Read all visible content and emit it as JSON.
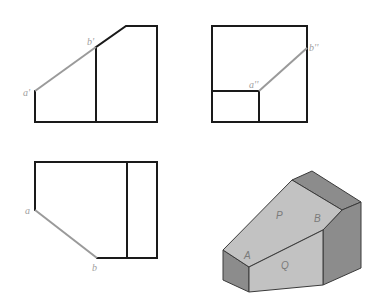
{
  "figure": {
    "front_view": {
      "label_a": "a'",
      "label_b": "b'"
    },
    "side_view": {
      "label_a": "a''",
      "label_b": "b''"
    },
    "top_view": {
      "label_a": "a",
      "label_b": "b"
    },
    "isometric": {
      "face_labels": [
        "P",
        "B",
        "A",
        "Q"
      ],
      "colors": {
        "light_face": "#c2c2c2",
        "dark_face": "#8c8c8c",
        "edge": "#3a3a3a"
      }
    },
    "colors": {
      "outline": "#1a1a1a",
      "highlight_line": "#9a9a9a",
      "label": "#a0a0a0"
    }
  }
}
